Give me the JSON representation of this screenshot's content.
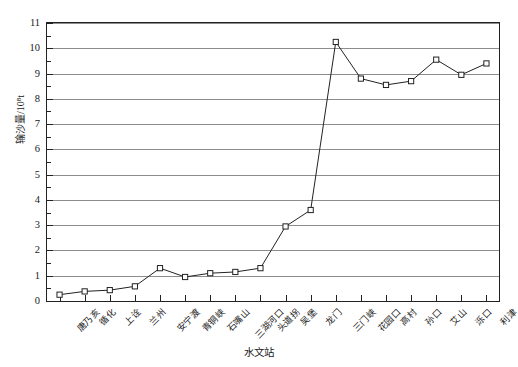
{
  "chart_data": {
    "type": "line",
    "title": "",
    "xlabel": "水文站",
    "ylabel": "输沙量/10⁸t",
    "categories": [
      "唐乃亥",
      "循化",
      "上诠",
      "兰州",
      "安宁渡",
      "青铜峡",
      "石嘴山",
      "三湖河口",
      "头道拐",
      "吴堡",
      "龙门",
      "三门峡",
      "花园口",
      "高村",
      "孙口",
      "艾山",
      "泺口",
      "利津"
    ],
    "values": [
      0.25,
      0.38,
      0.43,
      0.58,
      1.3,
      0.95,
      1.1,
      1.15,
      1.3,
      2.95,
      3.6,
      10.25,
      8.8,
      8.55,
      8.7,
      9.55,
      8.95,
      9.4
    ],
    "ylim": [
      0,
      11
    ],
    "yticks": [
      0,
      1,
      2,
      3,
      4,
      5,
      6,
      7,
      8,
      9,
      10,
      11
    ],
    "ytick_labels": [
      "0",
      "1",
      "2",
      "3",
      "4",
      "5",
      "6",
      "7",
      "8",
      "9",
      "10",
      "11"
    ],
    "grid": true,
    "legend": "none",
    "marker": "open-square",
    "line_color": "#222222",
    "grid_color": "#8d8d8d",
    "axis_color": "#222222"
  }
}
